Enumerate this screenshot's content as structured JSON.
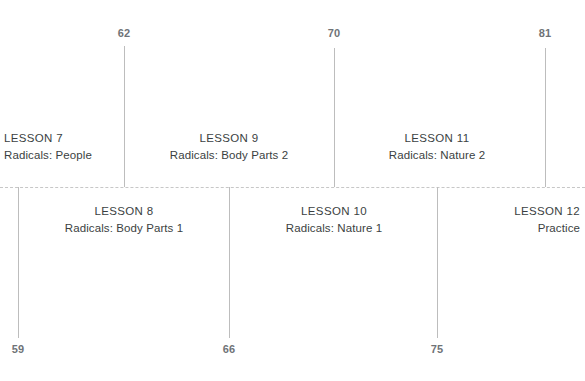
{
  "diagram": {
    "type": "lesson-timeline",
    "axis": {
      "style": "dashed",
      "color": "#c7c7c7",
      "y": 187
    },
    "colors": {
      "stem": "#bdbdbd",
      "number_text": "#6f7377",
      "label_text": "#3b3f42",
      "background": "#ffffff"
    },
    "endpoints_top": [
      {
        "value": "62",
        "x": 124
      },
      {
        "value": "70",
        "x": 334
      },
      {
        "value": "81",
        "x": 545
      }
    ],
    "endpoints_bottom": [
      {
        "value": "59",
        "x": 18
      },
      {
        "value": "66",
        "x": 229
      },
      {
        "value": "75",
        "x": 437
      }
    ],
    "lessons": [
      {
        "title": "LESSON 7",
        "subtitle": "Radicals: People",
        "side": "above",
        "align": "left",
        "x": 4,
        "stem_x": 18,
        "stem_top": 187,
        "stem_bottom": 338
      },
      {
        "title": "LESSON 8",
        "subtitle": "Radicals: Body Parts 1",
        "side": "below",
        "align": "center",
        "x": 124,
        "stem_x": 124,
        "stem_top": 46,
        "stem_bottom": 187
      },
      {
        "title": "LESSON 9",
        "subtitle": "Radicals: Body Parts 2",
        "side": "above",
        "align": "center",
        "x": 229,
        "stem_x": 229,
        "stem_top": 187,
        "stem_bottom": 338
      },
      {
        "title": "LESSON 10",
        "subtitle": "Radicals: Nature 1",
        "side": "below",
        "align": "center",
        "x": 334,
        "stem_x": 334,
        "stem_top": 48,
        "stem_bottom": 187
      },
      {
        "title": "LESSON 11",
        "subtitle": "Radicals: Nature 2",
        "side": "above",
        "align": "center",
        "x": 437,
        "stem_x": 437,
        "stem_top": 187,
        "stem_bottom": 338
      },
      {
        "title": "LESSON 12",
        "subtitle": "Practice",
        "side": "below",
        "align": "right",
        "x": 580,
        "stem_x": 545,
        "stem_top": 48,
        "stem_bottom": 187
      }
    ]
  }
}
